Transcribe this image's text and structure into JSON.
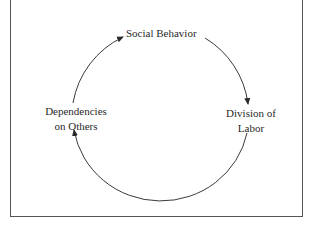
{
  "diagram": {
    "type": "cycle",
    "nodes": [
      {
        "id": "social-behavior",
        "label": "Social Behavior"
      },
      {
        "id": "division-of-labor",
        "label_line1": "Division of",
        "label_line2": "Labor"
      },
      {
        "id": "dependencies",
        "label_line1": "Dependencies",
        "label_line2": "on Others"
      }
    ],
    "edges": [
      {
        "from": "social-behavior",
        "to": "division-of-labor"
      },
      {
        "from": "division-of-labor",
        "to": "dependencies"
      },
      {
        "from": "dependencies",
        "to": "social-behavior"
      }
    ],
    "colors": {
      "line": "#3a3a3a",
      "text": "#2a2a2a",
      "frame": "#555555"
    }
  }
}
